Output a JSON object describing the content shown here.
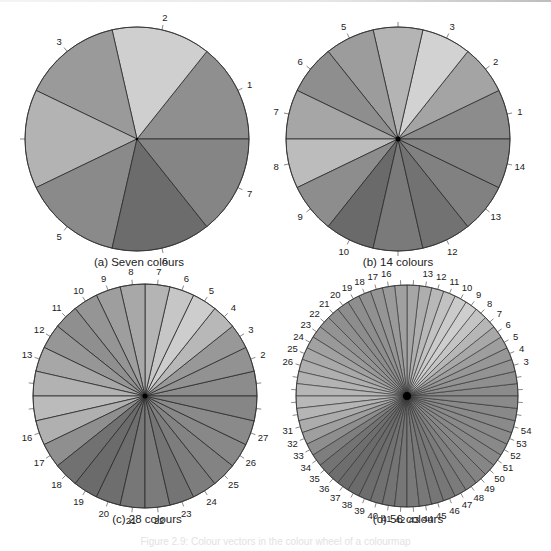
{
  "figure": {
    "caption": "Figure 2.9: Colour vectors in the colour wheel of a colourmap"
  },
  "chart_data": [
    {
      "type": "pie",
      "panel": "a",
      "title": "(a) Seven colours",
      "slices": 7,
      "values": [
        1,
        1,
        1,
        1,
        1,
        1,
        1
      ],
      "start_angle_deg": 0,
      "direction": "counterclockwise",
      "labels": [
        "1",
        "2",
        "3",
        "",
        "5",
        "6",
        "7"
      ],
      "colors": [
        "#8f8f8f",
        "#cfcfcf",
        "#9a9a9a",
        "#b3b3b3",
        "#8a8a8a",
        "#6c6c6c",
        "#858585"
      ],
      "center": [
        137,
        139
      ],
      "radius": 112
    },
    {
      "type": "pie",
      "panel": "b",
      "title": "(b) 14 colours",
      "slices": 14,
      "values": [
        1,
        1,
        1,
        1,
        1,
        1,
        1,
        1,
        1,
        1,
        1,
        1,
        1,
        1
      ],
      "start_angle_deg": 0,
      "direction": "counterclockwise",
      "labels": [
        "1",
        "2",
        "3",
        "",
        "5",
        "6",
        "7",
        "8",
        "9",
        "10",
        "",
        "12",
        "13",
        "14"
      ],
      "colors": [
        "#8c8c8c",
        "#a4a4a4",
        "#d2d2d2",
        "#b4b4b4",
        "#9c9c9c",
        "#8e8e8e",
        "#a6a6a6",
        "#bcbcbc",
        "#8d8d8d",
        "#6a6a6a",
        "#7a7a7a",
        "#727272",
        "#818181",
        "#858585"
      ],
      "center": [
        398,
        139
      ],
      "radius": 112
    },
    {
      "type": "pie",
      "panel": "c",
      "title": "(c) 28 colours",
      "slices": 28,
      "values": [
        1,
        1,
        1,
        1,
        1,
        1,
        1,
        1,
        1,
        1,
        1,
        1,
        1,
        1,
        1,
        1,
        1,
        1,
        1,
        1,
        1,
        1,
        1,
        1,
        1,
        1,
        1,
        1
      ],
      "start_angle_deg": 0,
      "direction": "counterclockwise",
      "labels": [
        "",
        "2",
        "3",
        "4",
        "5",
        "6",
        "7",
        "8",
        "9",
        "10",
        "11",
        "12",
        "13",
        "",
        "",
        "16",
        "17",
        "18",
        "19",
        "20",
        "21",
        "22",
        "23",
        "24",
        "25",
        "26",
        "27",
        ""
      ],
      "colors": [
        "#8c8c8c",
        "#929292",
        "#989898",
        "#b8b8b8",
        "#cdcdcd",
        "#c6c6c6",
        "#b4b4b4",
        "#a8a8a8",
        "#9e9e9e",
        "#959595",
        "#8f8f8f",
        "#969696",
        "#a7a7a7",
        "#b2b2b2",
        "#bbbbbb",
        "#b0b0b0",
        "#8f8f8f",
        "#717171",
        "#6b6b6b",
        "#6e6e6e",
        "#777777",
        "#7b7b7b",
        "#747474",
        "#7d7d7d",
        "#838383",
        "#888888",
        "#8a8a8a",
        "#868686"
      ],
      "center": [
        145,
        396
      ],
      "radius": 112
    },
    {
      "type": "pie",
      "panel": "d",
      "title": "(d) 56 colours",
      "slices": 56,
      "values": [
        1,
        1,
        1,
        1,
        1,
        1,
        1,
        1,
        1,
        1,
        1,
        1,
        1,
        1,
        1,
        1,
        1,
        1,
        1,
        1,
        1,
        1,
        1,
        1,
        1,
        1,
        1,
        1,
        1,
        1,
        1,
        1,
        1,
        1,
        1,
        1,
        1,
        1,
        1,
        1,
        1,
        1,
        1,
        1,
        1,
        1,
        1,
        1,
        1,
        1,
        1,
        1,
        1,
        1,
        1,
        1
      ],
      "start_angle_deg": 0,
      "direction": "counterclockwise",
      "labels": [
        "",
        "",
        "3",
        "4",
        "5",
        "6",
        "7",
        "8",
        "9",
        "10",
        "11",
        "12",
        "13",
        "",
        "",
        "16",
        "17",
        "18",
        "19",
        "20",
        "21",
        "22",
        "23",
        "24",
        "25",
        "26",
        "",
        "",
        "",
        "",
        "31",
        "32",
        "33",
        "34",
        "35",
        "36",
        "37",
        "38",
        "39",
        "40",
        "41",
        "42",
        "43",
        "44",
        "45",
        "46",
        "47",
        "48",
        "49",
        "50",
        "51",
        "52",
        "53",
        "54",
        "",
        ""
      ],
      "colors": [
        "#8b8b8b",
        "#8f8f8f",
        "#939393",
        "#979797",
        "#9e9e9e",
        "#a8a8a8",
        "#b6b6b6",
        "#c4c4c4",
        "#cecece",
        "#cbcbcb",
        "#c2c2c2",
        "#b8b8b8",
        "#aeaeae",
        "#a6a6a6",
        "#a0a0a0",
        "#9a9a9a",
        "#959595",
        "#919191",
        "#8e8e8e",
        "#8d8d8d",
        "#8f8f8f",
        "#939393",
        "#999999",
        "#a1a1a1",
        "#a9a9a9",
        "#afafaf",
        "#b3b3b3",
        "#b6b6b6",
        "#b8b8b8",
        "#b5b5b5",
        "#acacac",
        "#9f9f9f",
        "#8e8e8e",
        "#7e7e7e",
        "#737373",
        "#6e6e6e",
        "#6b6b6b",
        "#6b6b6b",
        "#6d6d6d",
        "#717171",
        "#747474",
        "#777777",
        "#797979",
        "#787878",
        "#767676",
        "#777777",
        "#7b7b7b",
        "#7f7f7f",
        "#838383",
        "#868686",
        "#888888",
        "#898989",
        "#8a8a8a",
        "#8a8a8a",
        "#898989",
        "#8a8a8a"
      ],
      "center": [
        407,
        396
      ],
      "radius": 111
    }
  ]
}
